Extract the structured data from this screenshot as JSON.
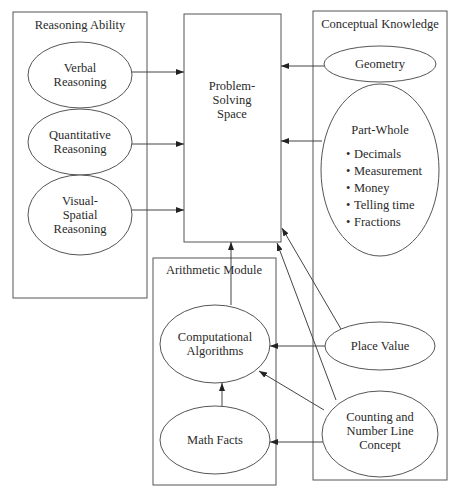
{
  "diagram": {
    "groups": {
      "reasoning": {
        "title": "Reasoning Ability"
      },
      "conceptual": {
        "title": "Conceptual Knowledge"
      },
      "arithmetic": {
        "title": "Arithmetic Module"
      }
    },
    "nodes": {
      "problem_solving": {
        "line1": "Problem-",
        "line2": "Solving",
        "line3": "Space"
      },
      "verbal": {
        "line1": "Verbal",
        "line2": "Reasoning"
      },
      "quantitative": {
        "line1": "Quantitative",
        "line2": "Reasoning"
      },
      "visual_spatial": {
        "line1": "Visual-",
        "line2": "Spatial",
        "line3": "Reasoning"
      },
      "geometry": {
        "label": "Geometry"
      },
      "part_whole": {
        "label": "Part-Whole",
        "items": [
          "Decimals",
          "Measurement",
          "Money",
          "Telling time",
          "Fractions"
        ]
      },
      "place_value": {
        "label": "Place Value"
      },
      "counting": {
        "line1": "Counting and",
        "line2": "Number Line",
        "line3": "Concept"
      },
      "computational": {
        "line1": "Computational",
        "line2": "Algorithms"
      },
      "math_facts": {
        "label": "Math Facts"
      }
    },
    "bullet": "•",
    "edges": [
      {
        "from": "Verbal Reasoning",
        "to": "Problem-Solving Space"
      },
      {
        "from": "Quantitative Reasoning",
        "to": "Problem-Solving Space"
      },
      {
        "from": "Visual-Spatial Reasoning",
        "to": "Problem-Solving Space"
      },
      {
        "from": "Geometry",
        "to": "Problem-Solving Space"
      },
      {
        "from": "Part-Whole",
        "to": "Problem-Solving Space"
      },
      {
        "from": "Place Value",
        "to": "Problem-Solving Space"
      },
      {
        "from": "Counting and Number Line Concept",
        "to": "Problem-Solving Space"
      },
      {
        "from": "Computational Algorithms",
        "to": "Problem-Solving Space"
      },
      {
        "from": "Place Value",
        "to": "Computational Algorithms"
      },
      {
        "from": "Counting and Number Line Concept",
        "to": "Computational Algorithms"
      },
      {
        "from": "Counting and Number Line Concept",
        "to": "Math Facts"
      },
      {
        "from": "Math Facts",
        "to": "Computational Algorithms"
      }
    ]
  }
}
